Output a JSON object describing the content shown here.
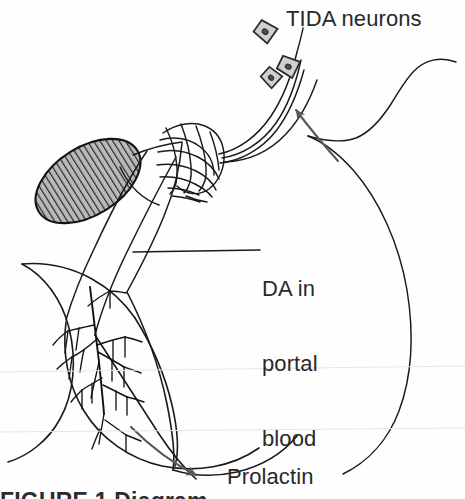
{
  "figure": {
    "background_color": "#fefefe",
    "ink_color": "#1a1a1a",
    "text_color": "#29292b",
    "arrow_color": "#595959",
    "hatch_fill": "#b8b8b8",
    "cell_fill": "#cfcfcf"
  },
  "labels": {
    "tida_neurons": "TIDA neurons",
    "da_portal_blood_line1": "DA in",
    "da_portal_blood_line2": "portal",
    "da_portal_blood_line3": "blood",
    "prolactin": "Prolactin"
  },
  "caption": {
    "text": "FIGURE 1  Diagram"
  },
  "structures": [
    {
      "name": "optic-chiasm",
      "description": "hatched grey oval, vertical line fill",
      "cx": 88,
      "cy": 181,
      "rx": 58,
      "ry": 34,
      "rotation": -32
    },
    {
      "name": "median-eminence-plexus",
      "description": "capillary mesh network",
      "x": 152,
      "y": 122
    },
    {
      "name": "pituitary-stalk",
      "description": "infundibulum tube descending left-down"
    },
    {
      "name": "anterior-pituitary",
      "description": "rounded gland lobe with vascular tree"
    },
    {
      "name": "vascular-tree",
      "description": "branching portal capillary tree inside gland"
    },
    {
      "name": "axon-bundle",
      "description": "three TIDA axon fibers to median eminence"
    }
  ],
  "neurons": [
    {
      "name": "tida-cell-body-1",
      "cx": 265,
      "cy": 31,
      "size": 17,
      "rotation": 35
    },
    {
      "name": "tida-cell-body-2",
      "cx": 287,
      "cy": 66,
      "size": 16,
      "rotation": 28
    },
    {
      "name": "tida-cell-body-3",
      "cx": 272,
      "cy": 76,
      "size": 14,
      "rotation": 40
    }
  ],
  "arrows": [
    {
      "name": "feedback-arrow-to-tida",
      "points_to": "TIDA neurons",
      "tip_x": 285,
      "tip_y": 98,
      "direction": "up-left"
    },
    {
      "name": "prolactin-output-arrow",
      "points_to": "Prolactin",
      "tip_x": 214,
      "tip_y": 479,
      "direction": "down-right"
    }
  ],
  "leader_lines": [
    {
      "name": "da-portal-blood-leader",
      "from_x": 133,
      "from_y": 252,
      "to_x": 260,
      "to_y": 250
    }
  ]
}
